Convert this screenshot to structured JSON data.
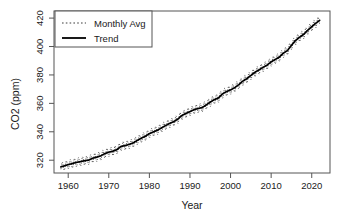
{
  "chart_data": {
    "type": "line",
    "title": "",
    "xlabel": "Year",
    "ylabel": "CO2 (ppm)",
    "xlim": [
      1956.5,
      2024.5
    ],
    "ylim": [
      311,
      425
    ],
    "xticks": [
      1960,
      1970,
      1980,
      1990,
      2000,
      2010,
      2020
    ],
    "yticks": [
      320,
      340,
      360,
      380,
      400,
      420
    ],
    "xtick_labels": [
      "1960",
      "1970",
      "1980",
      "1990",
      "2000",
      "2010",
      "2020"
    ],
    "ytick_labels": [
      "320",
      "340",
      "360",
      "380",
      "400",
      "420"
    ],
    "grid": false,
    "legend_position": "top-left",
    "series": [
      {
        "name": "Monthly Avg",
        "style": "dotted",
        "color": "#3c3c3c",
        "seasonal_amplitude_ppm": 3.1,
        "x": [
          1958.2,
          1959,
          1960,
          1961,
          1962,
          1963,
          1964,
          1965,
          1966,
          1967,
          1968,
          1969,
          1970,
          1971,
          1972,
          1973,
          1974,
          1975,
          1976,
          1977,
          1978,
          1979,
          1980,
          1981,
          1982,
          1983,
          1984,
          1985,
          1986,
          1987,
          1988,
          1989,
          1990,
          1991,
          1992,
          1993,
          1994,
          1995,
          1996,
          1997,
          1998,
          1999,
          2000,
          2001,
          2002,
          2003,
          2004,
          2005,
          2006,
          2007,
          2008,
          2009,
          2010,
          2011,
          2012,
          2013,
          2014,
          2015,
          2016,
          2017,
          2018,
          2019,
          2020,
          2021,
          2022
        ],
        "values": [
          315.3,
          315.98,
          316.91,
          317.64,
          318.45,
          318.99,
          319.62,
          320.04,
          321.38,
          322.16,
          323.04,
          324.62,
          325.68,
          326.32,
          327.45,
          329.68,
          330.25,
          331.15,
          332.15,
          333.9,
          335.5,
          336.85,
          338.69,
          339.93,
          341.13,
          342.78,
          344.42,
          345.9,
          347.15,
          348.93,
          351.48,
          352.91,
          354.19,
          355.59,
          356.37,
          357.04,
          358.89,
          360.88,
          362.64,
          363.76,
          366.63,
          368.31,
          369.48,
          371.02,
          373.1,
          375.64,
          377.38,
          379.67,
          381.84,
          383.55,
          385.34,
          386.95,
          389.21,
          390.9,
          392.52,
          395.34,
          397.15,
          400.83,
          404.24,
          406.55,
          408.52,
          411.43,
          413.94,
          416.41,
          418.56
        ]
      },
      {
        "name": "Trend",
        "style": "solid",
        "color": "#000000",
        "x": [
          1958.2,
          1959,
          1960,
          1961,
          1962,
          1963,
          1964,
          1965,
          1966,
          1967,
          1968,
          1969,
          1970,
          1971,
          1972,
          1973,
          1974,
          1975,
          1976,
          1977,
          1978,
          1979,
          1980,
          1981,
          1982,
          1983,
          1984,
          1985,
          1986,
          1987,
          1988,
          1989,
          1990,
          1991,
          1992,
          1993,
          1994,
          1995,
          1996,
          1997,
          1998,
          1999,
          2000,
          2001,
          2002,
          2003,
          2004,
          2005,
          2006,
          2007,
          2008,
          2009,
          2010,
          2011,
          2012,
          2013,
          2014,
          2015,
          2016,
          2017,
          2018,
          2019,
          2020,
          2021,
          2022
        ],
        "values": [
          315.3,
          315.98,
          316.91,
          317.64,
          318.45,
          318.99,
          319.62,
          320.04,
          321.38,
          322.16,
          323.04,
          324.62,
          325.68,
          326.32,
          327.45,
          329.68,
          330.25,
          331.15,
          332.15,
          333.9,
          335.5,
          336.85,
          338.69,
          339.93,
          341.13,
          342.78,
          344.42,
          345.9,
          347.15,
          348.93,
          351.48,
          352.91,
          354.19,
          355.59,
          356.37,
          357.04,
          358.89,
          360.88,
          362.64,
          363.76,
          366.63,
          368.31,
          369.48,
          371.02,
          373.1,
          375.64,
          377.38,
          379.67,
          381.84,
          383.55,
          385.34,
          386.95,
          389.21,
          390.9,
          392.52,
          395.34,
          397.15,
          400.83,
          404.24,
          406.55,
          408.52,
          411.43,
          413.94,
          416.41,
          418.56
        ]
      }
    ]
  },
  "legend": {
    "entries": [
      {
        "label": "Monthly Avg"
      },
      {
        "label": "Trend"
      }
    ]
  }
}
